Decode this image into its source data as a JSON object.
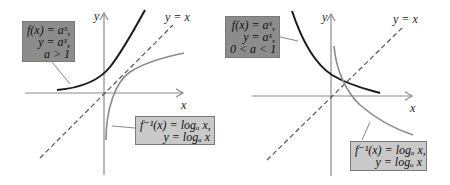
{
  "panels": [
    {
      "id": "left",
      "condition": "a > 1",
      "axes": {
        "x_label": "x",
        "y_label": "y"
      },
      "diagonal_label": "y = x",
      "exp_box": {
        "line1": "f(x) = aˣ,",
        "line2": "y = aˣ,",
        "line3": "a > 1"
      },
      "log_box": {
        "line1": "f⁻¹(x) = logₐ x,",
        "line2": "y = logₐ x"
      }
    },
    {
      "id": "right",
      "condition": "0 < a < 1",
      "axes": {
        "x_label": "x",
        "y_label": "y"
      },
      "diagonal_label": "y = x",
      "exp_box": {
        "line1": "f(x) = aˣ,",
        "line2": "y = aˣ,",
        "line3": "0 < a < 1"
      },
      "log_box": {
        "line1": "f⁻¹(x) = logₐ x,",
        "line2": "y = logₐ x"
      }
    }
  ],
  "colors": {
    "exp_curve": "#1a1a1a",
    "log_curve": "#8a8a8a",
    "axis": "#8a8a8a",
    "diagonal": "#555555",
    "exp_box_fill": "#8c8c8c",
    "log_box_fill": "#c9c9c9"
  }
}
